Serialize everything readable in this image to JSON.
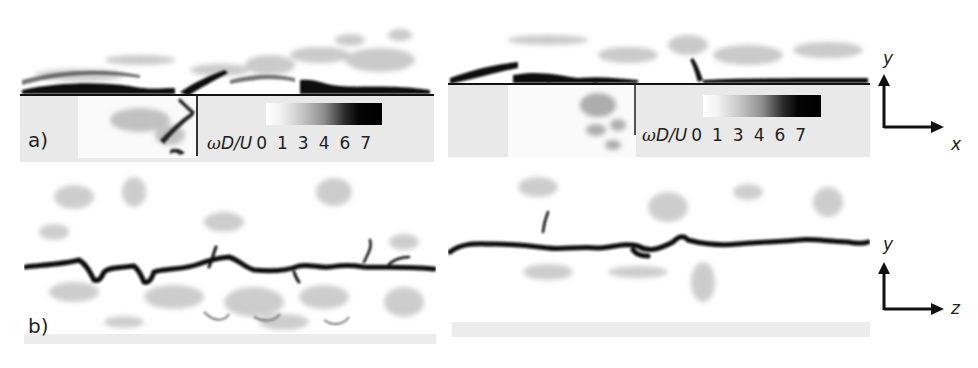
{
  "figure": {
    "panels": [
      {
        "id": "a",
        "label": "a)",
        "view": "side (x-y plane)",
        "colorbar": {
          "quantity_label": "ωD/U",
          "omega": "ω",
          "rest": "D/U",
          "ticks": [
            "0",
            "1",
            "3",
            "4",
            "6",
            "7"
          ],
          "colormap": "white-to-black"
        }
      },
      {
        "id": "b",
        "label": "b)",
        "view": "cross-section (z-y plane)"
      }
    ],
    "axes_glyphs": [
      {
        "vertical": "y",
        "horizontal": "x"
      },
      {
        "vertical": "y",
        "horizontal": "z"
      }
    ],
    "colors": {
      "vortex_core": "#0d0d0d",
      "background_grey": "#e9e9e9",
      "cavity_white": "#fafafa"
    }
  }
}
